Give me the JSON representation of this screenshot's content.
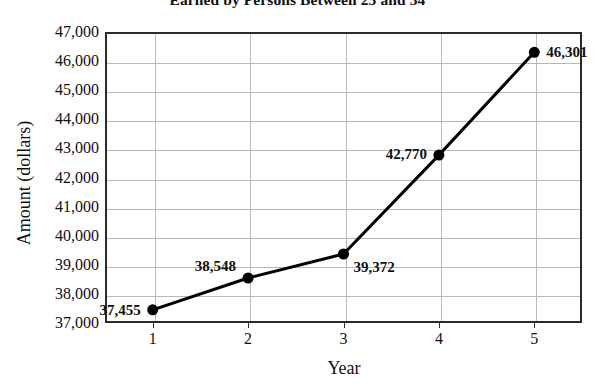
{
  "chart_data": {
    "type": "line",
    "title": "Earned by Persons Between 25 and 34",
    "xlabel": "Year",
    "ylabel": "Amount (dollars)",
    "x": [
      1,
      2,
      3,
      4,
      5
    ],
    "categories": [
      "1",
      "2",
      "3",
      "4",
      "5"
    ],
    "values": [
      37455,
      38548,
      39372,
      42770,
      46301
    ],
    "point_labels": [
      "37,455",
      "38,548",
      "39,372",
      "42,770",
      "46,301"
    ],
    "xtick_labels": [
      "1",
      "2",
      "3",
      "4",
      "5"
    ],
    "ytick_labels": [
      "47,000",
      "46,000",
      "45,000",
      "44,000",
      "43,000",
      "42,000",
      "41,000",
      "40,000",
      "39,000",
      "38,000",
      "37,000"
    ],
    "ytick_values": [
      47000,
      46000,
      45000,
      44000,
      43000,
      42000,
      41000,
      40000,
      39000,
      38000,
      37000
    ],
    "ylim": [
      37000,
      47000
    ],
    "xlim": [
      0.5,
      5.5
    ],
    "grid": true,
    "grid_axes": "both",
    "legend": false,
    "legend_position": "none",
    "series": [
      {
        "name": "Amount",
        "values": [
          37455,
          38548,
          39372,
          42770,
          46301
        ],
        "line_color": "#000000",
        "marker": "circle",
        "marker_color": "#000000"
      }
    ],
    "label_placements": [
      {
        "label": "37,455",
        "anchor": "right",
        "dx": -12,
        "dy": 0
      },
      {
        "label": "38,548",
        "anchor": "right",
        "dx": -12,
        "dy": -12
      },
      {
        "label": "39,372",
        "anchor": "left",
        "dx": 10,
        "dy": 13
      },
      {
        "label": "42,770",
        "anchor": "right",
        "dx": -12,
        "dy": -1
      },
      {
        "label": "46,301",
        "anchor": "left",
        "dx": 12,
        "dy": 0
      }
    ],
    "colors": {
      "line": "#000000",
      "marker": "#000000",
      "grid": "#b9b9b9",
      "frame": "#2a2a2a",
      "text": "#111111",
      "background": "#ffffff"
    }
  }
}
